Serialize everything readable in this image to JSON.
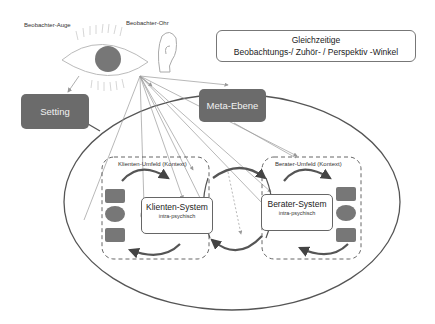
{
  "labels": {
    "observer_eye": "Beobachter-Auge",
    "observer_ear": "Beobachter-Ohr"
  },
  "title_box": {
    "line1": "Gleichzeitige",
    "line2": "Beobachtungs-/ Zuhör- / Perspektiv -Winkel"
  },
  "boxes": {
    "setting": "Setting",
    "meta": "Meta-Ebene"
  },
  "client": {
    "context_label": "Klienten-Umfeld (Kontext)",
    "system_title": "Klienten-System",
    "system_sub": "intra-psychisch"
  },
  "counselor": {
    "context_label": "Berater-Umfeld (Kontext)",
    "system_title": "Berater-System",
    "system_sub": "intra-psychisch"
  },
  "colors": {
    "dark_fill": "#6b6b6b",
    "line": "#555555",
    "arrow": "#444444"
  }
}
